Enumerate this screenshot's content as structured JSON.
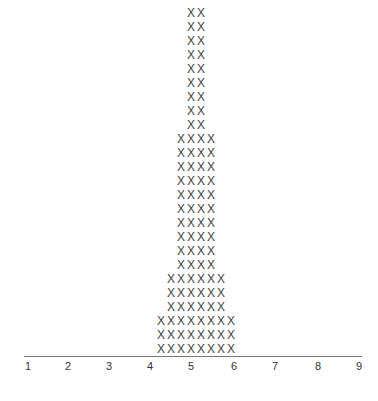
{
  "chart_data": {
    "type": "scatter",
    "subtype": "dot-plot",
    "title": "",
    "xlabel": "",
    "ylabel": "",
    "marker": "X",
    "x_ticks": [
      "1",
      "2",
      "3",
      "4",
      "5",
      "6",
      "7",
      "8",
      "9"
    ],
    "xlim": [
      1,
      9
    ],
    "grid": false,
    "legend": null,
    "rows_from_bottom": [
      {
        "count": 3,
        "width": 8
      },
      {
        "count": 3,
        "width": 6
      },
      {
        "count": 10,
        "width": 4
      },
      {
        "count": 9,
        "width": 2
      }
    ],
    "stack_widths_bottom_to_top": [
      8,
      8,
      8,
      6,
      6,
      6,
      4,
      4,
      4,
      4,
      4,
      4,
      4,
      4,
      4,
      4,
      2,
      2,
      2,
      2,
      2,
      2,
      2,
      2,
      2
    ],
    "total_marks": 100,
    "center": 5
  }
}
